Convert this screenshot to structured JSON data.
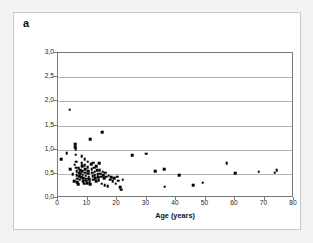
{
  "figure": {
    "panel_label": "a",
    "background_color": "#f2f2f2",
    "frame_color": "#c8c8c8",
    "plot_background": "#ffffff",
    "marker_color": "#000000",
    "gridline_color": "#b4b4b4",
    "axis_color": "#7a7a7a"
  },
  "chart_data": {
    "type": "scatter",
    "title": "",
    "subtitle": "",
    "xlabel": "Age (years)",
    "ylabel": "Neopterin in urine (mmol/mol creatinine)",
    "xlim": [
      0,
      80
    ],
    "ylim": [
      0,
      3
    ],
    "xticks": [
      0,
      10,
      20,
      30,
      40,
      50,
      60,
      70,
      80
    ],
    "yticks": [
      0,
      0.5,
      1,
      1.5,
      2,
      2.5,
      3
    ],
    "xtick_labels": [
      "0",
      "10",
      "20",
      "30",
      "40",
      "50",
      "60",
      "70",
      "80"
    ],
    "ytick_labels": [
      "0,0",
      "0,5",
      "1,0",
      "1,5",
      "2,0",
      "2,5",
      "3,0"
    ],
    "grid": "horizontal",
    "legend": "none",
    "marker": "square",
    "series": [
      {
        "name": "Neopterin in urine",
        "points": [
          [
            1.0,
            0.8
          ],
          [
            3.0,
            0.93
          ],
          [
            3.9,
            1.83
          ],
          [
            4.2,
            0.6
          ],
          [
            5.0,
            0.49
          ],
          [
            5.4,
            0.35
          ],
          [
            5.6,
            0.69
          ],
          [
            5.8,
            1.11
          ],
          [
            5.9,
            1.05
          ],
          [
            6.0,
            1.01
          ],
          [
            6.0,
            0.9
          ],
          [
            6.1,
            0.75
          ],
          [
            6.2,
            0.63
          ],
          [
            6.3,
            0.55
          ],
          [
            6.4,
            0.47
          ],
          [
            6.5,
            0.4
          ],
          [
            6.6,
            0.33
          ],
          [
            6.8,
            0.28
          ],
          [
            7.0,
            0.62
          ],
          [
            7.1,
            0.52
          ],
          [
            7.2,
            0.45
          ],
          [
            7.3,
            0.38
          ],
          [
            7.5,
            0.58
          ],
          [
            7.6,
            0.5
          ],
          [
            7.8,
            0.43
          ],
          [
            8.0,
            0.86
          ],
          [
            8.1,
            0.72
          ],
          [
            8.2,
            0.66
          ],
          [
            8.3,
            0.56
          ],
          [
            8.4,
            0.48
          ],
          [
            8.5,
            0.41
          ],
          [
            8.6,
            0.35
          ],
          [
            8.8,
            0.3
          ],
          [
            9.0,
            0.8
          ],
          [
            9.1,
            0.68
          ],
          [
            9.2,
            0.6
          ],
          [
            9.3,
            0.52
          ],
          [
            9.4,
            0.46
          ],
          [
            9.5,
            0.4
          ],
          [
            9.6,
            0.36
          ],
          [
            9.8,
            0.31
          ],
          [
            10.0,
            0.75
          ],
          [
            10.1,
            0.64
          ],
          [
            10.2,
            0.56
          ],
          [
            10.3,
            0.5
          ],
          [
            10.4,
            0.44
          ],
          [
            10.5,
            0.39
          ],
          [
            10.7,
            0.34
          ],
          [
            10.9,
            0.29
          ],
          [
            11.0,
            1.22
          ],
          [
            11.2,
            0.7
          ],
          [
            11.4,
            0.6
          ],
          [
            11.5,
            0.52
          ],
          [
            11.7,
            0.45
          ],
          [
            11.9,
            0.38
          ],
          [
            12.0,
            0.73
          ],
          [
            12.2,
            0.63
          ],
          [
            12.4,
            0.54
          ],
          [
            12.5,
            0.47
          ],
          [
            12.7,
            0.41
          ],
          [
            12.9,
            0.35
          ],
          [
            13.0,
            0.66
          ],
          [
            13.2,
            0.57
          ],
          [
            13.4,
            0.49
          ],
          [
            13.6,
            0.43
          ],
          [
            13.8,
            0.37
          ],
          [
            14.0,
            0.72
          ],
          [
            14.2,
            0.58
          ],
          [
            14.4,
            0.5
          ],
          [
            14.6,
            0.44
          ],
          [
            14.8,
            0.3
          ],
          [
            15.0,
            1.36
          ],
          [
            15.2,
            0.54
          ],
          [
            15.4,
            0.47
          ],
          [
            15.6,
            0.41
          ],
          [
            15.8,
            0.26
          ],
          [
            16.0,
            0.52
          ],
          [
            16.4,
            0.44
          ],
          [
            16.8,
            0.24
          ],
          [
            17.2,
            0.46
          ],
          [
            17.6,
            0.38
          ],
          [
            18.0,
            0.43
          ],
          [
            18.5,
            0.35
          ],
          [
            19.0,
            0.41
          ],
          [
            19.5,
            0.3
          ],
          [
            20.0,
            0.44
          ],
          [
            20.5,
            0.36
          ],
          [
            21.0,
            0.22
          ],
          [
            21.5,
            0.17
          ],
          [
            22.0,
            0.38
          ],
          [
            25.2,
            0.88
          ],
          [
            29.8,
            0.92
          ],
          [
            33.0,
            0.56
          ],
          [
            36.0,
            0.59
          ],
          [
            36.2,
            0.23
          ],
          [
            41.0,
            0.47
          ],
          [
            45.8,
            0.26
          ],
          [
            49.0,
            0.32
          ],
          [
            57.2,
            0.72
          ],
          [
            60.0,
            0.51
          ],
          [
            68.0,
            0.54
          ],
          [
            73.4,
            0.52
          ],
          [
            74.2,
            0.57
          ]
        ]
      }
    ]
  }
}
